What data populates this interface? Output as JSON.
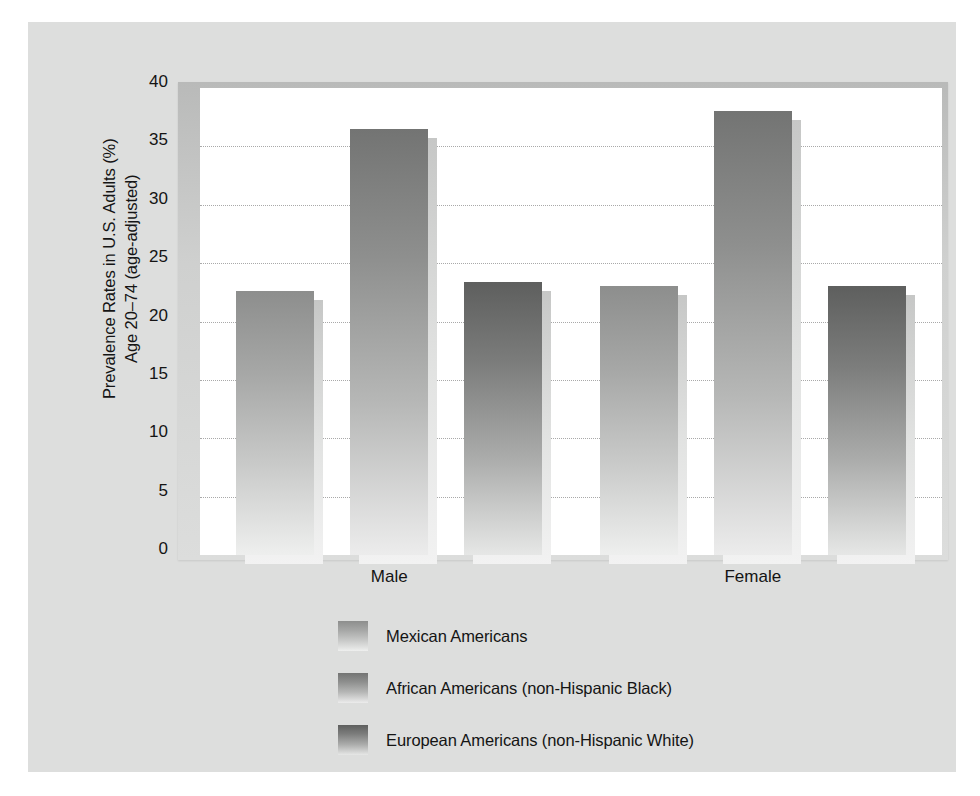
{
  "chart_data": {
    "type": "bar",
    "title": "",
    "subtitle": "",
    "xlabel": "",
    "ylabel": "Prevalence Rates in U.S. Adults (%)\nAge 20–74 (age-adjusted)",
    "categories": [
      "Male",
      "Female"
    ],
    "series": [
      {
        "name": "Mexican Americans",
        "values": [
          22.6,
          23.0
        ],
        "color": "#a7a8a7"
      },
      {
        "name": "African Americans (non-Hispanic Black)",
        "values": [
          36.5,
          38.0
        ],
        "color": "#8e8f8e"
      },
      {
        "name": "European Americans (non-Hispanic White)",
        "values": [
          23.4,
          23.0
        ],
        "color": "#7c7d7c"
      }
    ],
    "ylim": [
      0,
      40
    ],
    "yticks": [
      0,
      5,
      10,
      15,
      20,
      25,
      30,
      35,
      40
    ],
    "ytick_labels": [
      "0",
      "5",
      "10",
      "15",
      "20",
      "25",
      "30",
      "35",
      "40"
    ],
    "gridlines_at": [
      5,
      10,
      15,
      20,
      25,
      30,
      35
    ],
    "grid": true,
    "grid_style": "dotted",
    "grid_color": "#a9a9a9",
    "legend_position": "bottom-left",
    "bar_style": "vertical-gradient-with-drop-shadow",
    "figure_background": "#dddedd",
    "plot_background": "#ffffff"
  },
  "legend": {
    "items": [
      {
        "label": "Mexican Americans",
        "swatch_class": "bar-mexican"
      },
      {
        "label": "African Americans (non-Hispanic Black)",
        "swatch_class": "bar-african"
      },
      {
        "label": "European Americans (non-Hispanic White)",
        "swatch_class": "bar-european"
      }
    ]
  }
}
